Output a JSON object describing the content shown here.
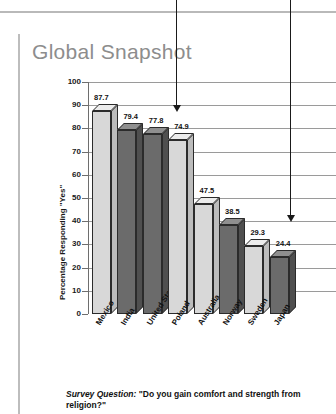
{
  "page_title": "Global Snapshot",
  "caption": {
    "lead": "Survey Question:",
    "text": " \"Do you gain comfort and strength from religion?\""
  },
  "colors": {
    "title": "#8d8d8d",
    "accent_bar": "#bdbdbd",
    "grid": "#9a9a9a",
    "bar_light": "#d8d8d8",
    "bar_dark": "#6b6b6b",
    "outline": "#2b2b2b"
  },
  "annotations": [
    {
      "name": "arrow-1",
      "x": 176,
      "top": 0,
      "bottom": 112
    },
    {
      "name": "arrow-2",
      "x": 290,
      "top": 0,
      "bottom": 222
    }
  ],
  "chart_data": {
    "type": "bar",
    "title": "Global Snapshot",
    "categories": [
      "Mexico",
      "India",
      "United States",
      "Poland",
      "Australia",
      "Norway",
      "Sweden",
      "Japan"
    ],
    "values": [
      87.7,
      79.4,
      77.8,
      74.9,
      47.5,
      38.5,
      29.3,
      24.4
    ],
    "bar_shades": [
      "light",
      "dark",
      "dark",
      "light",
      "light",
      "dark",
      "light",
      "dark"
    ],
    "xlabel": "",
    "ylabel": "Percentage Responding \"Yes\"",
    "ylim": [
      0,
      100
    ],
    "ytick_labels": [
      "100",
      "90",
      "80",
      "70",
      "60",
      "50",
      "40",
      "30",
      "20",
      "10",
      "0"
    ],
    "ytick_values": [
      100,
      90,
      80,
      70,
      60,
      50,
      40,
      30,
      20,
      10,
      0
    ],
    "grid": true,
    "legend": "none",
    "data_labels": [
      "87.7",
      "79.4",
      "77.8",
      "74.9",
      "47.5",
      "38.5",
      "29.3",
      "24.4"
    ]
  }
}
